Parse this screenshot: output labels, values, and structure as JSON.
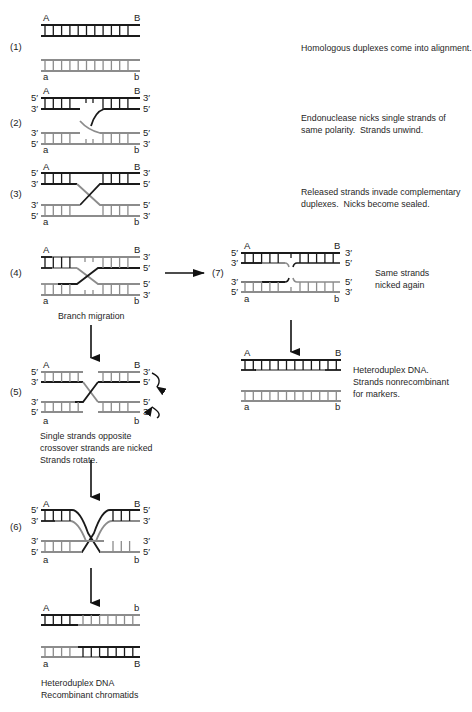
{
  "diagram": {
    "colors": {
      "dark_strand": "#1a1a1a",
      "light_strand": "#8c8c8c",
      "background": "#ffffff"
    },
    "steps": [
      {
        "id": "1",
        "label": "(1)",
        "caption": "Homologous duplexes come into alignment.",
        "top_markers": {
          "left": "A",
          "right": "B"
        },
        "bottom_markers": {
          "left": "a",
          "right": "b"
        }
      },
      {
        "id": "2",
        "label": "(2)",
        "caption": "Endonuclease nicks single strands of\nsame polarity.  Strands unwind.",
        "top_markers": {
          "left": "A",
          "right": "B"
        },
        "bottom_markers": {
          "left": "a",
          "right": "b"
        }
      },
      {
        "id": "3",
        "label": "(3)",
        "caption": "Released strands invade complementary\nduplexes.  Nicks become sealed.",
        "top_markers": {
          "left": "A",
          "right": "B"
        },
        "bottom_markers": {
          "left": "a",
          "right": "b"
        }
      },
      {
        "id": "4",
        "label": "(4)",
        "caption": "Branch migration",
        "top_markers": {
          "left": "A",
          "right": "B"
        },
        "bottom_markers": {
          "left": "a",
          "right": "b"
        }
      },
      {
        "id": "5",
        "label": "(5)",
        "caption": "Single strands opposite\ncrossover strands are nicked\nStrands rotate.",
        "top_markers": {
          "left": "A",
          "right": "B"
        },
        "bottom_markers": {
          "left": "a",
          "right": "b"
        }
      },
      {
        "id": "6",
        "label": "(6)",
        "caption": "",
        "top_markers": {
          "left": "A",
          "right": "B"
        },
        "bottom_markers": {
          "left": "a",
          "right": "b"
        }
      },
      {
        "id": "7",
        "label": "(7)",
        "caption": "Same strands\nnicked again",
        "top_markers": {
          "left": "A",
          "right": "B"
        },
        "bottom_markers": {
          "left": "a",
          "right": "b"
        }
      }
    ],
    "results": {
      "recombinant": {
        "caption": "Heteroduplex DNA\nRecombinant chromatids",
        "top_markers": {
          "left": "A",
          "right": "b"
        },
        "bottom_markers": {
          "left": "a",
          "right": "B"
        }
      },
      "nonrecombinant": {
        "caption": "Heteroduplex DNA.\nStrands nonrecombinant\nfor markers.",
        "top_markers": {
          "left": "A",
          "right": "B"
        },
        "bottom_markers": {
          "left": "a",
          "right": "b"
        }
      }
    },
    "polarity": {
      "five": "5′",
      "three": "3′"
    }
  }
}
